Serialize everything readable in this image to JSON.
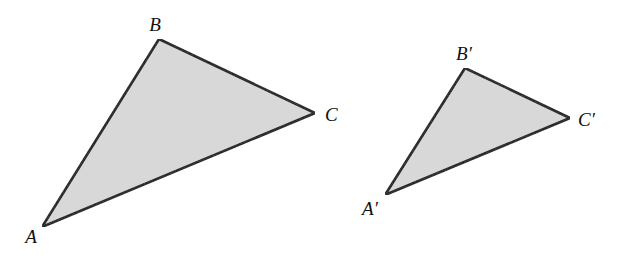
{
  "diagram": {
    "fill_color": "#dadada",
    "stroke_color": "#111111",
    "triangles": [
      {
        "name": "triangle-ABC",
        "vertices": [
          {
            "label": "A",
            "x": 42,
            "y": 227,
            "label_x": 31,
            "label_y": 243
          },
          {
            "label": "B",
            "x": 159,
            "y": 39,
            "label_x": 155,
            "label_y": 31
          },
          {
            "label": "C",
            "x": 315,
            "y": 113,
            "label_x": 325,
            "label_y": 121
          }
        ]
      },
      {
        "name": "triangle-A'B'C'",
        "vertices": [
          {
            "label": "A′",
            "x": 385,
            "y": 195,
            "label_x": 370,
            "label_y": 215
          },
          {
            "label": "B′",
            "x": 465,
            "y": 68,
            "label_x": 464,
            "label_y": 60
          },
          {
            "label": "C′",
            "x": 570,
            "y": 118,
            "label_x": 578,
            "label_y": 126
          }
        ]
      }
    ]
  }
}
